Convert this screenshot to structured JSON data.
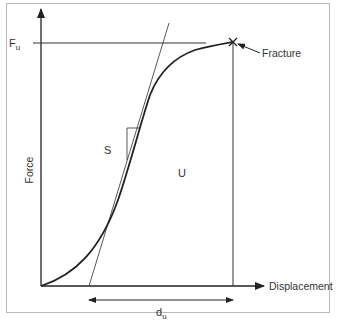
{
  "diagram": {
    "type": "force-displacement-curve",
    "y_axis_label": "Force",
    "x_axis_label": "Displacement",
    "ultimate_force_label": "F",
    "ultimate_force_subscript": "u",
    "fracture_label": "Fracture",
    "stiffness_label": "S",
    "energy_label": "U",
    "ultimate_displacement_label": "d",
    "ultimate_displacement_subscript": "u",
    "colors": {
      "line": "#222222",
      "frame": "#b8b8b8",
      "text": "#333333"
    }
  }
}
